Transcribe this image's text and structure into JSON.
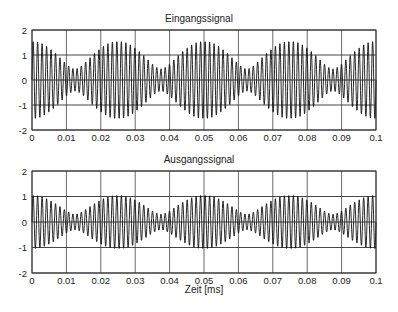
{
  "chart_data": [
    {
      "type": "line",
      "title": "Eingangssignal",
      "xlabel": "",
      "ylabel": "",
      "xlim": [
        0,
        0.1
      ],
      "ylim": [
        -2,
        2
      ],
      "xticks": [
        "0",
        "0.01",
        "0.02",
        "0.03",
        "0.04",
        "0.05",
        "0.06",
        "0.07",
        "0.08",
        "0.09",
        "0.1"
      ],
      "yticks": [
        "2",
        "1",
        "0",
        "-1",
        "-2"
      ],
      "grid": true,
      "description": "Beat signal: ~76 carrier cycles over 0.1, envelope period ~0.025; envelope max ~1.55 near x=0, 0.025, 0.05, 0.075, 0.1 and min ~0.45 near 0.0125, 0.0375, 0.0625, 0.0875",
      "series": [
        {
          "name": "Eingangssignal",
          "components": [
            {
              "amplitude": 1.0,
              "cycles_per_unit": 780
            },
            {
              "amplitude": 0.55,
              "cycles_per_unit": 740
            }
          ]
        }
      ],
      "envelope_max": 1.55,
      "envelope_min": 0.45
    },
    {
      "type": "line",
      "title": "Ausgangssignal",
      "xlabel": "Zeit [ms]",
      "ylabel": "",
      "xlim": [
        0,
        0.1
      ],
      "ylim": [
        -2,
        2
      ],
      "xticks": [
        "0",
        "0.01",
        "0.02",
        "0.03",
        "0.04",
        "0.05",
        "0.06",
        "0.07",
        "0.08",
        "0.09",
        "0.1"
      ],
      "yticks": [
        "2",
        "1",
        "0",
        "-1",
        "-2"
      ],
      "grid": true,
      "description": "Filtered beat signal: same carrier, envelope max ~1.05 and min ~0.3, envelope period ~0.025",
      "series": [
        {
          "name": "Ausgangssignal",
          "components": [
            {
              "amplitude": 0.68,
              "cycles_per_unit": 780
            },
            {
              "amplitude": 0.37,
              "cycles_per_unit": 740
            }
          ]
        }
      ],
      "envelope_max": 1.05,
      "envelope_min": 0.31
    }
  ],
  "plots": {
    "top": {
      "title": "Eingangssignal"
    },
    "bottom": {
      "title": "Ausgangssignal",
      "xlabel": "Zeit [ms]"
    }
  }
}
